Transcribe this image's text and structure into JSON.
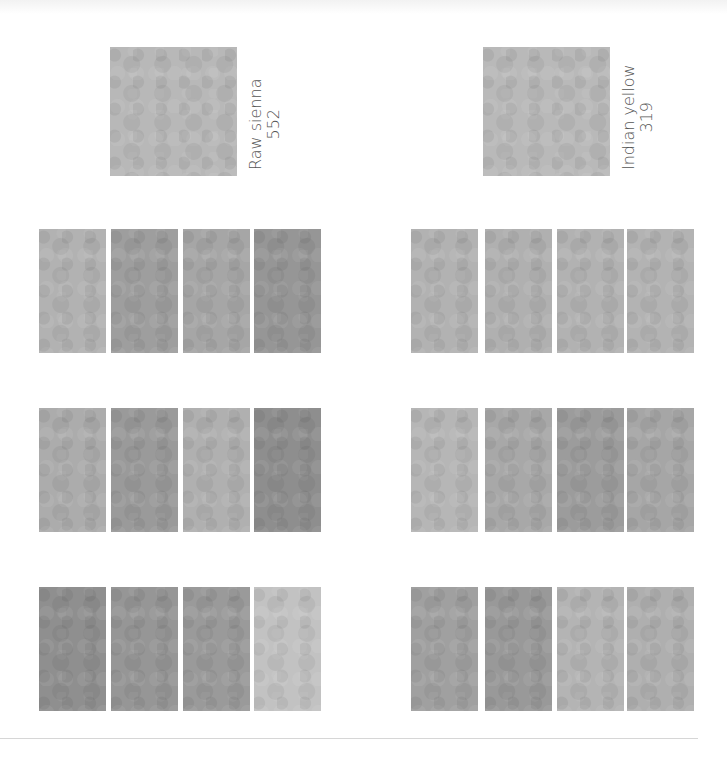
{
  "panels": [
    {
      "name": "Raw sienna",
      "code": "552",
      "main_swatch": {
        "color": "#b8b8b8",
        "x": 110,
        "y": 47,
        "w": 127,
        "h": 129
      },
      "label_pos": {
        "x": 247,
        "y": 170
      },
      "rows": [
        {
          "y": 229,
          "colors": [
            "#b2b2b2",
            "#9e9e9e",
            "#a6a6a6",
            "#969696"
          ]
        },
        {
          "y": 408,
          "colors": [
            "#acacac",
            "#9a9a9a",
            "#b0b0b0",
            "#8e8e8e"
          ]
        },
        {
          "y": 587,
          "colors": [
            "#8f8f8f",
            "#969696",
            "#9a9a9a",
            "#c2c2c2"
          ]
        }
      ],
      "col_x": [
        39,
        111,
        183,
        254
      ],
      "sw_w": 67
    },
    {
      "name": "Indian yellow",
      "code": "319",
      "main_swatch": {
        "color": "#b9b9b9",
        "x": 483,
        "y": 47,
        "w": 127,
        "h": 129
      },
      "label_pos": {
        "x": 620,
        "y": 170
      },
      "rows": [
        {
          "y": 229,
          "colors": [
            "#b2b2b2",
            "#b0b0b0",
            "#b2b2b2",
            "#b3b3b3"
          ]
        },
        {
          "y": 408,
          "colors": [
            "#b6b6b6",
            "#a8a8a8",
            "#9c9c9c",
            "#a6a6a6"
          ]
        },
        {
          "y": 587,
          "colors": [
            "#a0a0a0",
            "#999999",
            "#b4b4b4",
            "#afafaf"
          ]
        }
      ],
      "col_x": [
        411,
        485,
        557,
        627
      ],
      "sw_w": 67
    }
  ],
  "swatch_height": 124
}
